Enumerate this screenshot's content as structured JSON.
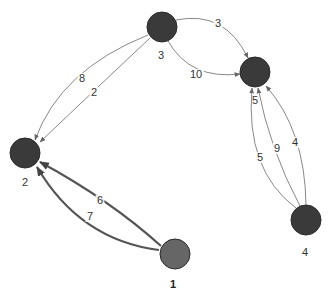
{
  "graph": {
    "directed": true,
    "nodes": [
      {
        "id": "1",
        "label": "1",
        "x": 175,
        "y": 254,
        "color": "#666666",
        "label_x": 173,
        "label_y": 288,
        "bold": true
      },
      {
        "id": "2",
        "label": "2",
        "x": 25,
        "y": 153,
        "color": "#3a3a3a",
        "label_x": 25,
        "label_y": 186,
        "bold": false
      },
      {
        "id": "3",
        "label": "3",
        "x": 162,
        "y": 27,
        "color": "#3a3a3a",
        "label_x": 161,
        "label_y": 59,
        "bold": false
      },
      {
        "id": "4",
        "label": "4",
        "x": 306,
        "y": 220,
        "color": "#3a3a3a",
        "label_x": 305,
        "label_y": 256,
        "bold": false
      },
      {
        "id": "5",
        "label": "5",
        "x": 255,
        "y": 72,
        "color": "#3a3a3a",
        "label_x": 255,
        "label_y": 104,
        "bold": false
      }
    ],
    "edges": [
      {
        "from": "3",
        "to": "5",
        "weight": "3",
        "path": "M176,20 Q225,10 248,58",
        "label_x": 218,
        "label_y": 27,
        "thick": false
      },
      {
        "from": "3",
        "to": "5",
        "weight": "10",
        "path": "M168,41 Q190,80 240,74",
        "label_x": 196,
        "label_y": 78,
        "thick": false
      },
      {
        "from": "3",
        "to": "2",
        "weight": "8",
        "path": "M148,35 Q60,70 35,140",
        "label_x": 82,
        "label_y": 82,
        "thick": false
      },
      {
        "from": "3",
        "to": "2",
        "weight": "2",
        "path": "M150,38 Q100,85 40,142",
        "label_x": 94,
        "label_y": 96,
        "thick": false
      },
      {
        "from": "1",
        "to": "2",
        "weight": "6",
        "path": "M161,246 Q110,200 40,162",
        "label_x": 100,
        "label_y": 204,
        "thick": true
      },
      {
        "from": "1",
        "to": "2",
        "weight": "7",
        "path": "M159,250 Q80,240 37,167",
        "label_x": 90,
        "label_y": 220,
        "thick": true
      },
      {
        "from": "4",
        "to": "5",
        "weight": "5",
        "path": "M296,208 Q245,170 252,88",
        "label_x": 260,
        "label_y": 161,
        "thick": false
      },
      {
        "from": "4",
        "to": "5",
        "weight": "9",
        "path": "M300,206 Q270,150 258,88",
        "label_x": 277,
        "label_y": 152,
        "thick": false
      },
      {
        "from": "4",
        "to": "5",
        "weight": "4",
        "path": "M306,205 Q305,130 266,86",
        "label_x": 295,
        "label_y": 146,
        "thick": false
      }
    ],
    "node_radius": 15,
    "edge_color": "#888888",
    "thick_edge_color": "#555555"
  }
}
